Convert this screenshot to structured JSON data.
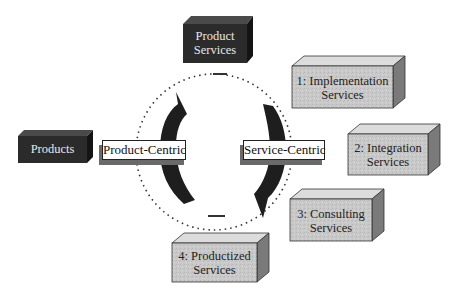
{
  "diagram": {
    "center_boxes": {
      "product_services": {
        "line1": "Product",
        "line2": "Services",
        "style": "dark"
      },
      "products": {
        "label": "Products",
        "style": "dark"
      }
    },
    "cycle_labels": {
      "left": "Product-Centric",
      "right": "Service-Centric"
    },
    "service_boxes": [
      {
        "line1": "1: Implementation",
        "line2": "Services",
        "style": "light"
      },
      {
        "line1": "2: Integration",
        "line2": "Services",
        "style": "light"
      },
      {
        "line1": "3: Consulting",
        "line2": "Services",
        "style": "light"
      },
      {
        "line1": "4: Productized",
        "line2": "Services",
        "style": "light"
      }
    ],
    "colors": {
      "dark_box": "#2b2b2b",
      "light_box": "#c8c8c8",
      "arrow": "#1e1e1e",
      "shadow": "#6a6a6a"
    }
  }
}
